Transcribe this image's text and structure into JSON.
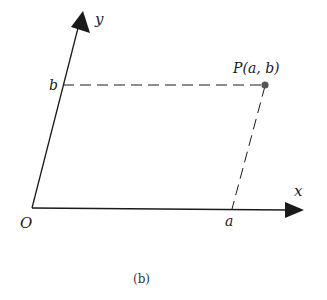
{
  "figure": {
    "caption": "(b)",
    "axes": {
      "x_label": "x",
      "y_label": "y",
      "origin_label": "O"
    },
    "point": {
      "label": "P(a, b)",
      "x_coord_label": "a",
      "y_coord_label": "b"
    },
    "colors": {
      "ink": "#1a1a1a",
      "point": "#555555"
    }
  }
}
